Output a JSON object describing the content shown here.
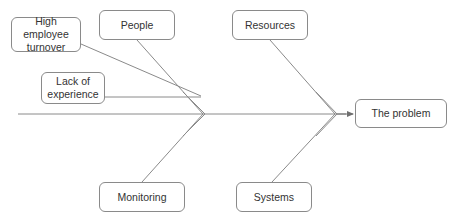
{
  "diagram": {
    "type": "fishbone-ishikawa",
    "title": "",
    "background_color": "#ffffff",
    "line_color": "#8a8a8a",
    "box_border_color": "#8a8a8a",
    "text_color": "#333333",
    "effect": {
      "label": "The problem",
      "x": 355,
      "y": 99,
      "w": 92,
      "h": 29
    },
    "causes": [
      {
        "id": "high-employee-turnover",
        "label": "High employee\nturnover",
        "x": 11,
        "y": 17,
        "w": 70,
        "h": 35,
        "side": "top"
      },
      {
        "id": "people",
        "label": "People",
        "x": 99,
        "y": 10,
        "w": 76,
        "h": 30,
        "side": "top"
      },
      {
        "id": "lack-of-experience",
        "label": "Lack of\nexperience",
        "x": 41,
        "y": 72,
        "w": 64,
        "h": 32,
        "side": "top"
      },
      {
        "id": "resources",
        "label": "Resources",
        "x": 232,
        "y": 10,
        "w": 76,
        "h": 30,
        "side": "top"
      },
      {
        "id": "monitoring",
        "label": "Monitoring",
        "x": 99,
        "y": 182,
        "w": 86,
        "h": 30,
        "side": "bottom"
      },
      {
        "id": "systems",
        "label": "Systems",
        "x": 236,
        "y": 182,
        "w": 76,
        "h": 30,
        "side": "bottom"
      }
    ],
    "spine": {
      "y": 114,
      "x_start": 18,
      "x_end": 350,
      "junctions": [
        203,
        335
      ]
    },
    "connectors": [
      {
        "id": "connector-high-employee-turnover",
        "x1": 81,
        "y1": 44,
        "x2": 200,
        "y2": 96
      },
      {
        "id": "connector-people",
        "x1": 137,
        "y1": 40,
        "x2": 203,
        "y2": 114
      },
      {
        "id": "connector-lack-of-experience",
        "x1": 105,
        "y1": 97,
        "x2": 200,
        "y2": 97
      },
      {
        "id": "connector-resources",
        "x1": 270,
        "y1": 40,
        "x2": 335,
        "y2": 114
      },
      {
        "id": "connector-monitoring",
        "x1": 142,
        "y1": 182,
        "x2": 203,
        "y2": 114
      },
      {
        "id": "connector-systems",
        "x1": 272,
        "y1": 182,
        "x2": 335,
        "y2": 114
      }
    ]
  }
}
